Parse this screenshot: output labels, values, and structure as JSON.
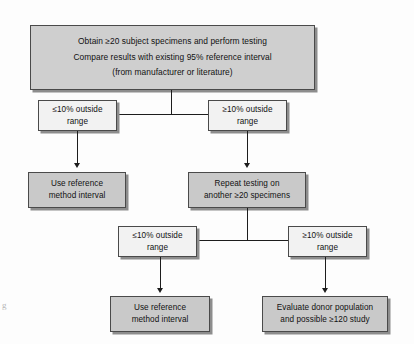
{
  "diagram": {
    "colors": {
      "filled_box": "#c9c9c9",
      "plain_box": "#f2f2f2",
      "header_box": "#cfcfcf",
      "border": "#4a4a4a",
      "shadow": "#8d8d8d",
      "connector": "#1d1d1d",
      "page": "#fdfdfd"
    },
    "margin_glyph": "g",
    "nodes": {
      "start": {
        "line1": "Obtain ≥20 subject specimens and perform testing",
        "line2": "Compare results with existing 95% reference interval",
        "line3": "(from manufacturer or literature)"
      },
      "decision_1_left": "≤10% outside\nrange",
      "decision_1_right": "≥10% outside\nrange",
      "outcome_1": "Use reference\nmethod interval",
      "repeat": "Repeat testing on\nanother ≥20 specimens",
      "decision_2_left": "≤10% outside\nrange",
      "decision_2_right": "≥10% outside\nrange",
      "outcome_2": "Use reference\nmethod interval",
      "outcome_3": "Evaluate donor population\nand possible ≥120 study"
    }
  }
}
